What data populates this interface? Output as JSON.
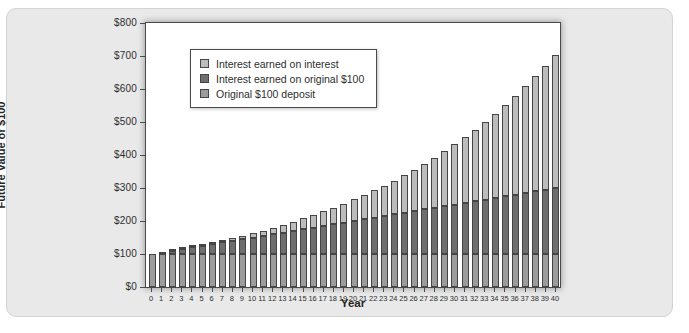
{
  "figure": {
    "background": "#ffffff",
    "card_background": "#e8e9e8"
  },
  "chart_data": {
    "type": "bar",
    "stacked": true,
    "title": "",
    "xlabel": "Year",
    "ylabel": "Future Value of $100",
    "ylim": [
      0,
      800
    ],
    "ytick_step": 100,
    "ytick_labels": [
      "$0",
      "$100",
      "$200",
      "$300",
      "$400",
      "$500",
      "$600",
      "$700",
      "$800"
    ],
    "grid": false,
    "bar_border_color": "#454545",
    "x": [
      0,
      1,
      2,
      3,
      4,
      5,
      6,
      7,
      8,
      9,
      10,
      11,
      12,
      13,
      14,
      15,
      16,
      17,
      18,
      19,
      20,
      21,
      22,
      23,
      24,
      25,
      26,
      27,
      28,
      29,
      30,
      31,
      32,
      33,
      34,
      35,
      36,
      37,
      38,
      39,
      40
    ],
    "series": [
      {
        "name": "Original $100 deposit",
        "color": "#9c9c9c",
        "values": [
          100,
          100,
          100,
          100,
          100,
          100,
          100,
          100,
          100,
          100,
          100,
          100,
          100,
          100,
          100,
          100,
          100,
          100,
          100,
          100,
          100,
          100,
          100,
          100,
          100,
          100,
          100,
          100,
          100,
          100,
          100,
          100,
          100,
          100,
          100,
          100,
          100,
          100,
          100,
          100,
          100
        ]
      },
      {
        "name": "Interest earned on original $100",
        "color": "#6e6e6e",
        "values": [
          0,
          5,
          10,
          15,
          20,
          25,
          30,
          35,
          40,
          45,
          50,
          55,
          60,
          65,
          70,
          75,
          80,
          85,
          90,
          95,
          100,
          105,
          110,
          115,
          120,
          125,
          130,
          135,
          140,
          145,
          150,
          155,
          160,
          165,
          170,
          175,
          180,
          185,
          190,
          195,
          200
        ]
      },
      {
        "name": "Interest earned on interest",
        "color": "#bcbcbc",
        "values": [
          0,
          0,
          0.25,
          0.76,
          1.55,
          2.63,
          4.01,
          5.71,
          7.75,
          10.13,
          12.89,
          16.03,
          19.59,
          23.56,
          27.99,
          32.89,
          38.29,
          44.2,
          50.66,
          57.7,
          65.33,
          73.6,
          82.53,
          92.15,
          102.51,
          113.64,
          125.57,
          138.35,
          152.01,
          166.61,
          182.19,
          198.8,
          216.49,
          235.32,
          255.33,
          276.6,
          299.18,
          323.14,
          348.55,
          375.48,
          404
        ]
      }
    ],
    "legend": {
      "position": "top-left-inside",
      "entries": [
        {
          "label": "Interest earned on interest",
          "color": "#bcbcbc"
        },
        {
          "label": "Interest earned on original $100",
          "color": "#6e6e6e"
        },
        {
          "label": "Original $100 deposit",
          "color": "#9c9c9c"
        }
      ]
    }
  }
}
